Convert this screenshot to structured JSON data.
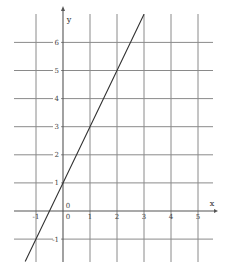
{
  "chart_data": {
    "type": "line",
    "title": "",
    "xlabel": "x",
    "ylabel": "y",
    "xlim": [
      -1.5,
      5.5
    ],
    "ylim": [
      -2,
      7
    ],
    "grid": true,
    "x_ticks": [
      -1,
      0,
      1,
      2,
      3,
      4,
      5
    ],
    "y_ticks": [
      -1,
      0,
      1,
      2,
      3,
      4,
      5,
      6
    ],
    "x_tick_labels": [
      "-1",
      "0",
      "1",
      "2",
      "3",
      "4",
      "5"
    ],
    "y_tick_labels": [
      "-1",
      "0",
      "1",
      "2",
      "3",
      "4",
      "5",
      "6"
    ],
    "origin_label": "0",
    "series": [
      {
        "name": "y = 2x + 1",
        "x": [
          -1.4,
          -1,
          0,
          1,
          2,
          3
        ],
        "y": [
          -1.8,
          -1,
          1,
          3,
          5,
          7
        ],
        "color": "#333333"
      }
    ]
  }
}
